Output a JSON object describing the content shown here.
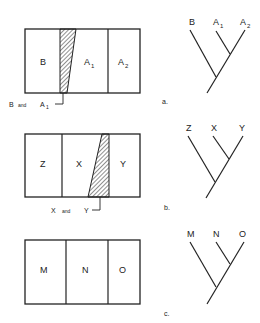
{
  "panels": [
    {
      "id": "a",
      "caption": "a.",
      "regions": [
        {
          "label": "B",
          "sub": ""
        },
        {
          "label": "A",
          "sub": "1"
        },
        {
          "label": "A",
          "sub": "2"
        }
      ],
      "overlap_label": {
        "left": "B",
        "and": "and",
        "right": "A",
        "right_sub": "1"
      },
      "tree": {
        "leaves": [
          {
            "label": "B",
            "sub": ""
          },
          {
            "label": "A",
            "sub": "1"
          },
          {
            "label": "A",
            "sub": "2"
          }
        ]
      }
    },
    {
      "id": "b",
      "caption": "b.",
      "regions": [
        {
          "label": "Z",
          "sub": ""
        },
        {
          "label": "X",
          "sub": ""
        },
        {
          "label": "Y",
          "sub": ""
        }
      ],
      "overlap_label": {
        "left": "X",
        "and": "and",
        "right": "Y",
        "right_sub": ""
      },
      "tree": {
        "leaves": [
          {
            "label": "Z",
            "sub": ""
          },
          {
            "label": "X",
            "sub": ""
          },
          {
            "label": "Y",
            "sub": ""
          }
        ]
      }
    },
    {
      "id": "c",
      "caption": "c.",
      "regions": [
        {
          "label": "M",
          "sub": ""
        },
        {
          "label": "N",
          "sub": ""
        },
        {
          "label": "O",
          "sub": ""
        }
      ],
      "tree": {
        "leaves": [
          {
            "label": "M",
            "sub": ""
          },
          {
            "label": "N",
            "sub": ""
          },
          {
            "label": "O",
            "sub": ""
          }
        ]
      }
    }
  ],
  "colors": {
    "ink": "#222222",
    "background": "#ffffff"
  }
}
